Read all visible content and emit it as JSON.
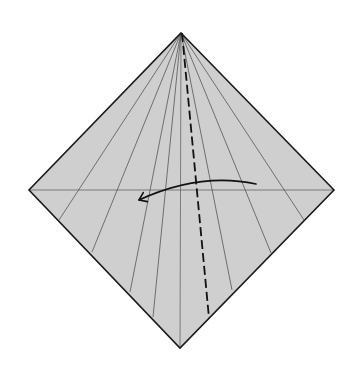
{
  "diagram": {
    "type": "origami-fold-step",
    "canvas": {
      "width": 352,
      "height": 375,
      "background": "#ffffff"
    },
    "paper": {
      "shape": "square-rotated-45",
      "fill": "#cfcfcf",
      "stroke": "#1a1a1a",
      "vertices": {
        "top": [
          181,
          33
        ],
        "right": [
          334,
          190
        ],
        "bottom": [
          180,
          348
        ],
        "left": [
          29,
          190
        ]
      }
    },
    "center_creases": {
      "horizontal": {
        "from": [
          29,
          190
        ],
        "to": [
          334,
          190
        ],
        "color": "#666666"
      },
      "vertical": {
        "from": [
          181,
          33
        ],
        "to": [
          180,
          348
        ],
        "color": "#666666"
      }
    },
    "radial_creases": {
      "apex": [
        181,
        33
      ],
      "color": "#555555",
      "ends": [
        [
          59,
          220
        ],
        [
          92,
          252
        ],
        [
          130,
          292
        ],
        [
          153,
          317
        ],
        [
          232,
          290
        ],
        [
          271,
          253
        ],
        [
          304,
          220
        ]
      ]
    },
    "valley_fold_line": {
      "style": "dashed",
      "color": "#111111",
      "from": [
        182,
        33
      ],
      "to": [
        209,
        318
      ]
    },
    "fold_arrow": {
      "direction": "right-to-left",
      "color": "#111111",
      "start": [
        256,
        184
      ],
      "control": [
        200,
        172
      ],
      "end": [
        139,
        200
      ]
    }
  }
}
